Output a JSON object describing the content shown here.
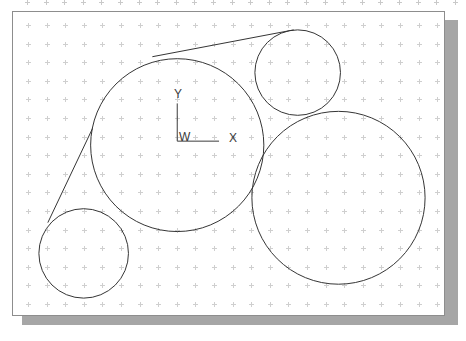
{
  "window": {
    "title": "CAD Drawing Canvas",
    "background_color": "#ffffff",
    "canvas_background_color": "#ffffff",
    "canvas_border_color": "#8d8d8d",
    "shadow_color": "#a6a6a6",
    "geometry_stroke_color": "#333333",
    "grid_dot_color": "#cfcfcf",
    "ucs_color": "#3a3a3a"
  },
  "canvas": {
    "left": 12,
    "top": 11,
    "width": 433,
    "height": 305,
    "grid": {
      "visible": true,
      "spacing_x": 18.6,
      "spacing_y": 18.6,
      "origin_x": 15,
      "origin_y": 13,
      "columns": 23,
      "rows": 16
    }
  },
  "ucs_icon": {
    "name": "world-coordinate-system-icon",
    "origin_label": "W",
    "x_axis_label": "X",
    "y_axis_label": "Y",
    "origin_x": 165,
    "origin_y": 130,
    "x_axis_length": 42,
    "y_axis_length": 38
  },
  "chart_data": {
    "type": "scatter",
    "title": "",
    "xlabel": "X",
    "ylabel": "Y",
    "grid": true,
    "legend": "none",
    "coordinate_origin_label": "W",
    "units": "pixels",
    "viewport": {
      "width": 433,
      "height": 305
    },
    "circles": [
      {
        "name": "large-center-circle",
        "cx": 165,
        "cy": 134,
        "r": 87,
        "stroke": "#333333",
        "fill": "none",
        "stroke_width": 1
      },
      {
        "name": "top-right-circle",
        "cx": 286,
        "cy": 61,
        "r": 43,
        "stroke": "#333333",
        "fill": "none",
        "stroke_width": 1
      },
      {
        "name": "bottom-right-circle",
        "cx": 327,
        "cy": 187,
        "r": 87,
        "stroke": "#333333",
        "fill": "none",
        "stroke_width": 1
      },
      {
        "name": "bottom-left-circle",
        "cx": 71,
        "cy": 243,
        "r": 45,
        "stroke": "#333333",
        "fill": "none",
        "stroke_width": 1
      }
    ],
    "tangent_lines": [
      {
        "name": "upper-tangent-line",
        "x1": 140,
        "y1": 45,
        "x2": 282,
        "y2": 18,
        "stroke": "#333333",
        "stroke_width": 1
      },
      {
        "name": "left-tangent-line",
        "x1": 80,
        "y1": 117,
        "x2": 35,
        "y2": 212,
        "stroke": "#333333",
        "stroke_width": 1
      }
    ]
  }
}
